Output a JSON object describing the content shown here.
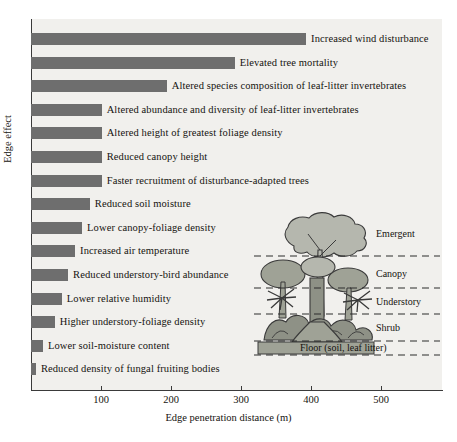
{
  "chart_data": {
    "type": "bar",
    "orientation": "horizontal",
    "title": "",
    "xlabel": "Edge penetration distance (m)",
    "ylabel": "Edge effect",
    "xlim": [
      0,
      560
    ],
    "xticks": [
      100,
      200,
      300,
      400,
      500
    ],
    "xtick_labels": [
      "100",
      "200",
      "300",
      "400",
      "500"
    ],
    "grid": false,
    "bar_color": "#6e6e6e",
    "plot_background": "#f1f0ed",
    "categories": [
      "Increased wind disturbance",
      "Elevated tree mortality",
      "Altered species composition of leaf-litter invertebrates",
      "Altered abundance and diversity of leaf-litter invertebrates",
      "Altered height of greatest foliage density",
      "Reduced canopy height",
      "Faster recruitment of disturbance-adapted trees",
      "Reduced soil moisture",
      "Lower canopy-foliage density",
      "Increased air temperature",
      "Reduced understory-bird abundance",
      "Lower relative humidity",
      "Higher understory-foliage density",
      "Lower soil-moisture content",
      "Reduced density of fungal fruiting bodies"
    ],
    "values": [
      393,
      291,
      194,
      101,
      101,
      101,
      101,
      84,
      73,
      63,
      53,
      44,
      34,
      17,
      7
    ]
  },
  "inset": {
    "name": "forest-strata-diagram",
    "strata": [
      {
        "key": "emergent",
        "label": "Emergent"
      },
      {
        "key": "canopy",
        "label": "Canopy"
      },
      {
        "key": "understory",
        "label": "Understory"
      },
      {
        "key": "shrub",
        "label": "Shrub"
      },
      {
        "key": "floor",
        "label": "Floor (soil, leaf litter)"
      }
    ]
  }
}
